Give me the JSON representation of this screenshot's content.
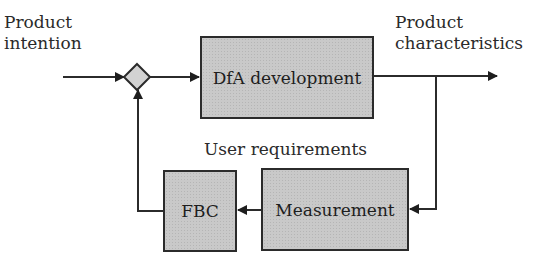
{
  "diagram": {
    "input_label": {
      "line1": "Product",
      "line2": "intention"
    },
    "output_label": {
      "line1": "Product",
      "line2": "characteristics"
    },
    "feedback_label": "User requirements",
    "blocks": {
      "dfa": "DfA development",
      "measurement": "Measurement",
      "fbc": "FBC"
    },
    "summing_junction": "comparator-diamond",
    "colors": {
      "line": "#2b2b2b",
      "block_fill": "#c9c9c9",
      "junction_fill": "#d2d2d2",
      "text": "#2a2a2a"
    }
  }
}
